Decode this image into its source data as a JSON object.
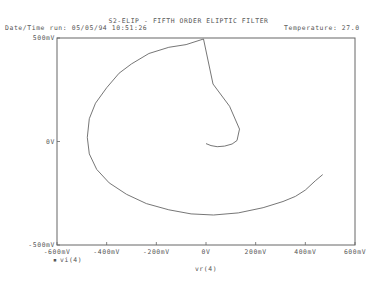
{
  "header": {
    "title": "S2-ELIP - FIFTH ORDER ELIPTIC FILTER",
    "run_info": "Date/Time run: 05/05/94  10:51:26",
    "temperature": "Temperature: 27.0"
  },
  "chart_data": {
    "type": "line",
    "title": "S2-ELIP - FIFTH ORDER ELIPTIC FILTER",
    "xlabel": "vr(4)",
    "ylabel": "",
    "legend": [
      "vi(4)"
    ],
    "legend_marker": "▪",
    "xlim": [
      -600,
      600
    ],
    "ylim": [
      -500,
      500
    ],
    "units": "mV",
    "grid": false,
    "x_ticks": [
      {
        "value": -600,
        "label": "-600mV"
      },
      {
        "value": -400,
        "label": "-400mV"
      },
      {
        "value": -200,
        "label": "-200mV"
      },
      {
        "value": 0,
        "label": "0V"
      },
      {
        "value": 200,
        "label": "200mV"
      },
      {
        "value": 400,
        "label": "400mV"
      },
      {
        "value": 600,
        "label": "600mV"
      }
    ],
    "y_ticks": [
      {
        "value": 500,
        "label": "500mV"
      },
      {
        "value": 0,
        "label": "0V"
      },
      {
        "value": -500,
        "label": "-500mV"
      }
    ],
    "series": [
      {
        "name": "vi(4) vs vr(4)",
        "x": [
          0,
          20,
          45,
          75,
          105,
          125,
          135,
          95,
          28,
          -10,
          -80,
          -150,
          -230,
          -300,
          -350,
          -400,
          -445,
          -470,
          -478,
          -470,
          -440,
          -390,
          -320,
          -240,
          -150,
          -60,
          30,
          130,
          230,
          310,
          360,
          400,
          440,
          470
        ],
        "y": [
          -10,
          -20,
          -25,
          -22,
          -12,
          5,
          60,
          170,
          278,
          495,
          468,
          455,
          425,
          375,
          330,
          260,
          185,
          110,
          20,
          -60,
          -135,
          -200,
          -255,
          -300,
          -330,
          -350,
          -355,
          -345,
          -320,
          -290,
          -265,
          -235,
          -190,
          -160
        ]
      }
    ]
  }
}
